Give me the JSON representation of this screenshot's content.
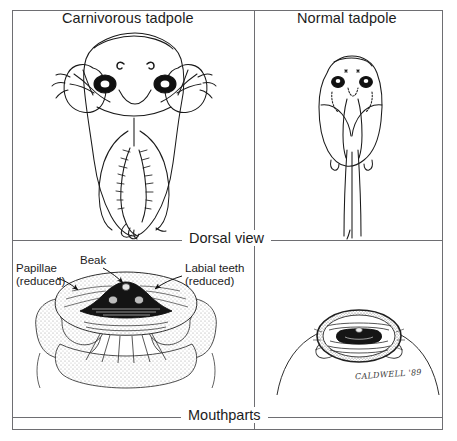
{
  "figure": {
    "signature": "CALDWELL '89"
  },
  "panels": {
    "top_left_title": "Carnivorous tadpole",
    "top_right_title": "Normal tadpole"
  },
  "row_captions": {
    "dorsal": "Dorsal view",
    "mouthparts": "Mouthparts"
  },
  "annotations": [
    {
      "name": "papillae",
      "line1": "Papillae",
      "line2": "(reduced)"
    },
    {
      "name": "beak",
      "line1": "Beak",
      "line2": ""
    },
    {
      "name": "labial-teeth",
      "line1": "Labial teeth",
      "line2": "(reduced)"
    }
  ],
  "colors": {
    "ink": "#1a1a1a",
    "frame": "#6e6e72",
    "background": "#ffffff",
    "stipple": "#8a8a8a"
  }
}
